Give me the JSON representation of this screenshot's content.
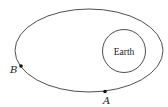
{
  "diagram": {
    "orbit": {
      "cx": 89,
      "cy": 50.5,
      "rx": 74,
      "ry": 41.5,
      "stroke": "#3a3a3a"
    },
    "earth": {
      "cx": 124,
      "cy": 51,
      "r": 21.5,
      "label": "Earth"
    },
    "points": [
      {
        "name": "B",
        "x": 21,
        "y": 66,
        "label": "B",
        "label_x": 10,
        "label_y": 73
      },
      {
        "name": "A",
        "x": 105,
        "y": 91.5,
        "label": "A",
        "label_x": 103,
        "label_y": 104
      }
    ]
  }
}
